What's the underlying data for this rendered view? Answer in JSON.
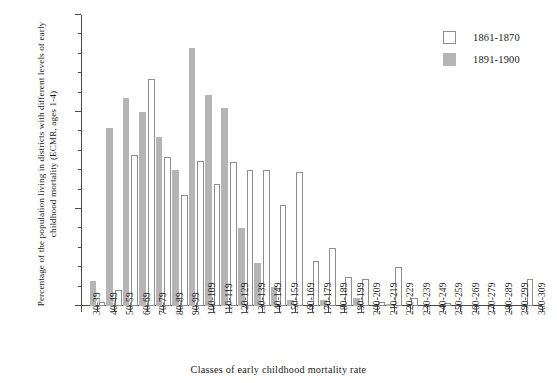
{
  "chart_data": {
    "type": "bar",
    "title": "",
    "xlabel": "Classes of early childhood mortality rate",
    "ylabel": "Percentage of the population living in districts with different levels of early childhood mortality (ECMR, ages 1-4)",
    "ylim": [
      0,
      15
    ],
    "yticks": [
      0,
      5,
      10,
      15
    ],
    "ytick_labels": [
      "0",
      "5",
      "10",
      "15"
    ],
    "y_minor_tick_step": 1,
    "grid": false,
    "legend_position": "top-right",
    "categories": [
      "30-39",
      "40-49",
      "50-59",
      "60-69",
      "70-79",
      "80-89",
      "90-99",
      "100-109",
      "110-119",
      "120-129",
      "130-139",
      "140-149",
      "150-159",
      "160-169",
      "170-179",
      "180-189",
      "190-199",
      "200-209",
      "210-219",
      "220-229",
      "230-239",
      "240-249",
      "250-259",
      "260-269",
      "270-279",
      "280-289",
      "290-299",
      "300-309"
    ],
    "series": [
      {
        "name": "1861-1870",
        "color": "#ffffff",
        "edge_color": "#8e8e8e",
        "values": [
          0.0,
          0.2,
          0.8,
          7.8,
          11.7,
          7.7,
          5.7,
          7.5,
          6.3,
          7.4,
          7.0,
          7.0,
          5.2,
          6.9,
          2.3,
          3.0,
          1.5,
          1.4,
          0.2,
          2.0,
          0.4,
          0.0,
          0.15,
          0.0,
          0.0,
          0.0,
          0.0,
          1.4
        ]
      },
      {
        "name": "1891-1900",
        "color": "#b5b5b5",
        "edge_color": "#b5b5b5",
        "values": [
          1.3,
          9.2,
          10.7,
          10.0,
          8.7,
          7.0,
          13.3,
          10.9,
          10.2,
          4.0,
          2.2,
          1.0,
          0.3,
          0.0,
          0.3,
          0.0,
          0.4,
          0.0,
          0.1,
          0.0,
          0.0,
          0.0,
          0.0,
          0.0,
          0.0,
          0.0,
          0.0,
          0.0
        ]
      }
    ]
  },
  "legend": {
    "items": [
      {
        "label": "1861-1870",
        "swatch": "white"
      },
      {
        "label": "1891-1900",
        "swatch": "grey"
      }
    ]
  },
  "axes": {
    "y_title": "Percentage of the population living in districts with different levels of early childhood mortality (ECMR, ages 1-4)",
    "x_title": "Classes of early childhood mortality rate"
  },
  "colors": {
    "series_1861_1870": "#ffffff",
    "series_1891_1900": "#b5b5b5",
    "axis": "#4a4a4a",
    "text": "#1a1a1a"
  }
}
